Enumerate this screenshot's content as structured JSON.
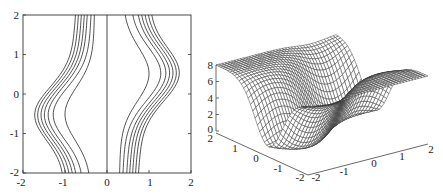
{
  "chart_data": [
    {
      "type": "contour",
      "title": "",
      "xlabel": "",
      "ylabel": "",
      "xlim": [
        -2,
        2
      ],
      "ylim": [
        -2,
        2
      ],
      "x_ticks": [
        "-2",
        "-1",
        "0",
        "1",
        "2"
      ],
      "y_ticks": [
        "2",
        "1",
        "0",
        "-1",
        "-2"
      ],
      "grid": false,
      "vertical_line_x": 0,
      "left_contour_family": {
        "count": 7,
        "bulge_direction": "left",
        "bulge_y": -0.5,
        "x_at_top": [
          -0.75,
          -0.68,
          -0.61,
          -0.54,
          -0.47,
          -0.38,
          -0.3
        ],
        "x_at_bulge": [
          -1.72,
          -1.65,
          -1.57,
          -1.49,
          -1.4,
          -1.28,
          -1.0
        ],
        "x_at_bottom": [
          -1.0,
          -0.92,
          -0.84,
          -0.76,
          -0.68,
          -0.55,
          -0.38
        ]
      },
      "right_contour_family": {
        "count": 7,
        "bulge_direction": "right",
        "bulge_y": 0.5,
        "x_at_top": [
          0.38,
          0.55,
          0.68,
          0.76,
          0.84,
          0.92,
          1.0
        ],
        "x_at_bulge": [
          1.0,
          1.28,
          1.4,
          1.49,
          1.57,
          1.65,
          1.72
        ],
        "x_at_bottom": [
          0.3,
          0.38,
          0.47,
          0.54,
          0.61,
          0.68,
          0.75
        ]
      }
    },
    {
      "type": "surface-mesh",
      "title": "",
      "z_ticks": [
        "8",
        "6",
        "4",
        "2",
        "0"
      ],
      "zlim": [
        0,
        8
      ],
      "left_axis_ticks": [
        "2",
        "1",
        "0",
        "-1",
        "-2"
      ],
      "right_axis_ticks": [
        "-2",
        "-1",
        "0",
        "1",
        "2"
      ],
      "description": "Wireframe surface: flat plateau at z≈8 on both sides with a deep curved trough (valley) down to z≈0 through the middle, following an S-shaped path"
    }
  ]
}
